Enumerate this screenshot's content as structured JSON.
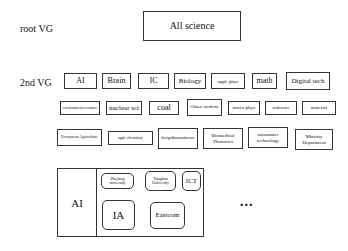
{
  "root": {
    "label": "root VG",
    "box": "All science"
  },
  "second": {
    "label": "2nd VG",
    "row1": [
      "AI",
      "Brain",
      "IC",
      "Biology",
      "appl. phys",
      "math",
      "Digital tech"
    ],
    "row2": [
      "environment resource",
      "nuclear sci",
      "coal",
      "Chinese medicine",
      "micro phys",
      "software",
      "material"
    ],
    "row3": [
      "Ecosystem Agriculture",
      "appl. chemistry",
      "design&manufacture",
      "Biomedical Photonics",
      "nanomater technology",
      "Ministry Department"
    ]
  },
  "group": {
    "title": "AI",
    "members": [
      "Zhejiang university",
      "Tsinghua University",
      "ICT",
      "IA",
      "Eastcom"
    ],
    "more": "..."
  }
}
